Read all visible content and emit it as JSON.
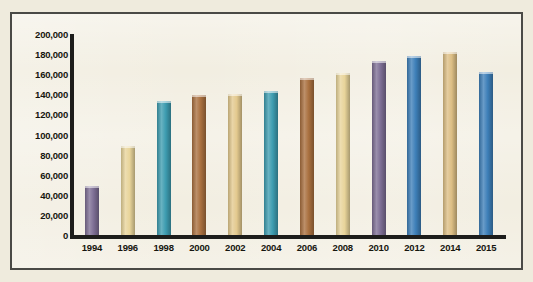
{
  "chart_data": {
    "type": "bar",
    "title": "",
    "subtitle": "",
    "xlabel": "",
    "ylabel": "",
    "categories": [
      "1994",
      "1996",
      "1998",
      "2000",
      "2002",
      "2004",
      "2006",
      "2008",
      "2010",
      "2012",
      "2014",
      "2015"
    ],
    "values": [
      49000,
      89000,
      133000,
      139000,
      140000,
      143000,
      156000,
      161000,
      173000,
      178000,
      182000,
      162000
    ],
    "bar_colors": [
      "#7d6e94",
      "#e8d49a",
      "#3d9cb0",
      "#a9703f",
      "#e3c98e",
      "#3d9cb0",
      "#a9703f",
      "#e8d49a",
      "#7d6e94",
      "#3d7fb8",
      "#dcbe84",
      "#3d7fb8"
    ],
    "ylim": [
      0,
      200000
    ],
    "ytick_step": 20000,
    "ytick_labels": [
      "200,000",
      "180,000",
      "160,000",
      "140,000",
      "120,000",
      "100,000",
      "80,000",
      "60,000",
      "40,000",
      "20,000",
      "0"
    ],
    "ytick_values": [
      200000,
      180000,
      160000,
      140000,
      120000,
      100000,
      80000,
      60000,
      40000,
      20000,
      0
    ],
    "grid": false,
    "legend": null,
    "legend_position": "none",
    "annotations": [],
    "plot_background": "#f2eee1",
    "axis_color": "#1d1d1b",
    "frame_color": "#4a4a46",
    "page_background": "#efebdd"
  }
}
